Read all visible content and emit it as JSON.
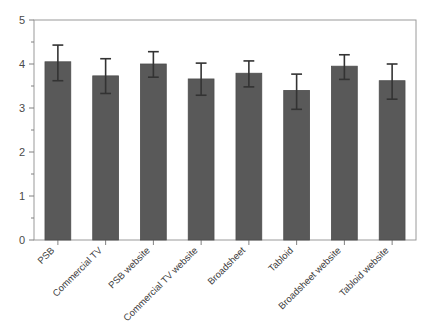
{
  "chart_data": {
    "type": "bar",
    "title": "",
    "xlabel": "",
    "ylabel": "",
    "ylim": [
      0,
      5
    ],
    "yticks": [
      0,
      1,
      2,
      3,
      4,
      5
    ],
    "ytick_labels": [
      "0",
      "1",
      "2",
      "3",
      "4",
      "5"
    ],
    "minor_ticks": true,
    "grid": false,
    "legend": null,
    "bar_color": "#595959",
    "bar_edge_color": "#4d4d4d",
    "error_bar_color": "#333333",
    "axis_color": "#808080",
    "categories": [
      "PSB",
      "Commercial TV",
      "PSB website",
      "Commercial TV website",
      "Broadsheet",
      "Tabloid",
      "Broadsheet website",
      "Tabloid website"
    ],
    "values": [
      4.05,
      3.73,
      4.0,
      3.66,
      3.79,
      3.4,
      3.95,
      3.62
    ],
    "error_low": [
      3.62,
      3.33,
      3.7,
      3.29,
      3.48,
      2.97,
      3.65,
      3.2
    ],
    "error_high": [
      4.43,
      4.12,
      4.28,
      4.02,
      4.07,
      3.77,
      4.21,
      4.0
    ],
    "tick_label_rotation": -45
  }
}
